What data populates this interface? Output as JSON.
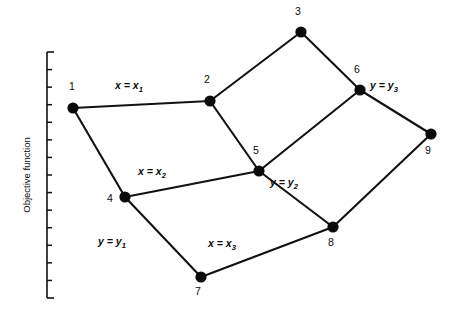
{
  "figure": {
    "type": "graph-network-diagram",
    "background_color": "#ffffff",
    "ink_color": "#0b0b0b"
  },
  "axis": {
    "caption": "Objective function",
    "orientation": "vertical",
    "x": 47,
    "top": 52,
    "bottom": 298,
    "bracket_width": 7,
    "tick_count": 13,
    "tick_length": 5,
    "caption_x": 30,
    "caption_y": 175
  },
  "nodes": [
    {
      "id": "1",
      "label": "1",
      "x": 73,
      "y": 108,
      "r": 5.6,
      "label_x": 72,
      "label_y": 90
    },
    {
      "id": "2",
      "label": "2",
      "x": 210,
      "y": 101,
      "r": 5.6,
      "label_x": 207,
      "label_y": 83
    },
    {
      "id": "3",
      "label": "3",
      "x": 301,
      "y": 32,
      "r": 5.6,
      "label_x": 298,
      "label_y": 15
    },
    {
      "id": "4",
      "label": "4",
      "x": 125,
      "y": 197,
      "r": 5.6,
      "label_x": 110,
      "label_y": 202
    },
    {
      "id": "5",
      "label": "5",
      "x": 259,
      "y": 171,
      "r": 5.6,
      "label_x": 256,
      "label_y": 154
    },
    {
      "id": "6",
      "label": "6",
      "x": 360,
      "y": 90,
      "r": 5.6,
      "label_x": 357,
      "label_y": 73
    },
    {
      "id": "7",
      "label": "7",
      "x": 201,
      "y": 277,
      "r": 5.6,
      "label_x": 198,
      "label_y": 295
    },
    {
      "id": "8",
      "label": "8",
      "x": 333,
      "y": 227,
      "r": 5.6,
      "label_x": 331,
      "label_y": 246
    },
    {
      "id": "9",
      "label": "9",
      "x": 431,
      "y": 134,
      "r": 5.6,
      "label_x": 428,
      "label_y": 154
    }
  ],
  "edges": [
    {
      "from": "1",
      "to": "2"
    },
    {
      "from": "2",
      "to": "3"
    },
    {
      "from": "3",
      "to": "6"
    },
    {
      "from": "1",
      "to": "4"
    },
    {
      "from": "2",
      "to": "5"
    },
    {
      "from": "4",
      "to": "5"
    },
    {
      "from": "5",
      "to": "6"
    },
    {
      "from": "5",
      "to": "8"
    },
    {
      "from": "6",
      "to": "9"
    },
    {
      "from": "4",
      "to": "7"
    },
    {
      "from": "7",
      "to": "8"
    },
    {
      "from": "8",
      "to": "9"
    }
  ],
  "edge_labels": [
    {
      "id": "x1",
      "base": "x = x",
      "sub": "1",
      "edge": "1-2",
      "x": 129,
      "y": 89
    },
    {
      "id": "x2",
      "base": "x = x",
      "sub": "2",
      "edge": "4-5",
      "x": 152,
      "y": 175
    },
    {
      "id": "x3",
      "base": "x = x",
      "sub": "3",
      "edge": "7-8",
      "x": 222,
      "y": 247
    },
    {
      "id": "y1",
      "base": "y = y",
      "sub": "1",
      "edge": "4-7",
      "x": 112,
      "y": 245
    },
    {
      "id": "y2",
      "base": "y = y",
      "sub": "2",
      "edge": "5-8",
      "x": 284,
      "y": 186
    },
    {
      "id": "y3",
      "base": "y = y",
      "sub": "3",
      "edge": "6-9",
      "x": 384,
      "y": 89
    }
  ]
}
